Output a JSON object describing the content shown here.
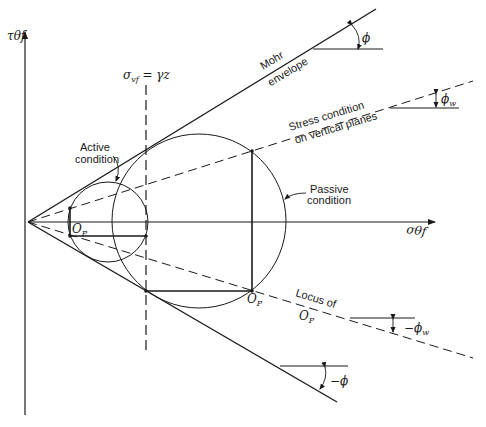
{
  "figure": {
    "type": "mohr-circle-diagram",
    "axes": {
      "vertical_label": "τθf",
      "horizontal_label": "σθf"
    },
    "lines": {
      "mohr_envelope_label_line1": "Mohr",
      "mohr_envelope_label_line2": "envelope",
      "stress_condition_line1": "Stress condition",
      "stress_condition_line2": "on vertical planes",
      "locus_line1": "Locus of",
      "locus_line2": "O",
      "locus_line2_sub": "P",
      "vertical_stress_label": "σ",
      "vertical_stress_sub": "vf",
      "vertical_stress_rhs": " = γz"
    },
    "circles": {
      "active_label_line1": "Active",
      "active_label_line2": "condition",
      "passive_label_line1": "Passive",
      "passive_label_line2": "condition"
    },
    "poles": {
      "active_pole": "O",
      "active_pole_sub": "P",
      "passive_pole": "O",
      "passive_pole_sub": "P"
    },
    "angles": {
      "phi": "ϕ",
      "phi_w": "ϕ",
      "phi_w_sub": "w",
      "neg_phi_w": "−ϕ",
      "neg_phi_w_sub": "w",
      "neg_phi": "−ϕ"
    },
    "colors": {
      "ink": "#1a1a1a",
      "background": "#ffffff"
    }
  }
}
